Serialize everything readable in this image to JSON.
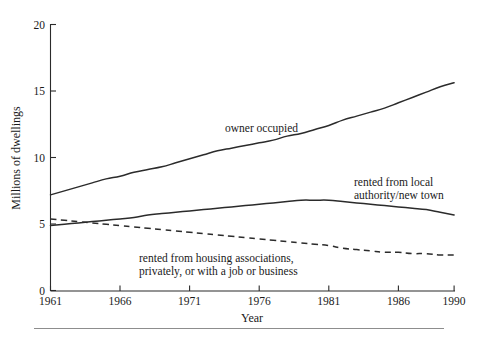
{
  "chart_data": {
    "type": "line",
    "title": "",
    "subtitle": "",
    "xlabel": "Year",
    "ylabel": "Millions of dwellings",
    "xlim": [
      1961,
      1990
    ],
    "ylim": [
      0,
      20
    ],
    "xticks": [
      1961,
      1966,
      1971,
      1976,
      1981,
      1986,
      1990
    ],
    "xtick_labels": [
      "1961",
      "1966",
      "1971",
      "1976",
      "1981",
      "1986",
      "1990"
    ],
    "yticks": [
      0,
      5,
      10,
      15,
      20
    ],
    "ytick_labels": [
      "0",
      "5",
      "10",
      "15",
      "20"
    ],
    "grid": false,
    "legend_position": "inline-annotations",
    "x": [
      1961,
      1962,
      1963,
      1964,
      1965,
      1966,
      1967,
      1968,
      1969,
      1970,
      1971,
      1972,
      1973,
      1974,
      1975,
      1976,
      1977,
      1978,
      1979,
      1980,
      1981,
      1982,
      1983,
      1984,
      1985,
      1986,
      1987,
      1988,
      1989,
      1990
    ],
    "series": [
      {
        "name": "owner occupied",
        "style": "solid",
        "color": "#2b2b2b",
        "values": [
          7.2,
          7.5,
          7.8,
          8.1,
          8.4,
          8.6,
          8.9,
          9.1,
          9.3,
          9.6,
          9.9,
          10.2,
          10.5,
          10.7,
          10.9,
          11.1,
          11.3,
          11.6,
          11.8,
          12.1,
          12.4,
          12.8,
          13.1,
          13.4,
          13.7,
          14.1,
          14.5,
          14.9,
          15.3,
          15.6
        ]
      },
      {
        "name": "rented from local authority/new town",
        "style": "solid",
        "color": "#2b2b2b",
        "values": [
          4.9,
          5.0,
          5.1,
          5.2,
          5.3,
          5.4,
          5.5,
          5.7,
          5.8,
          5.9,
          6.0,
          6.1,
          6.2,
          6.3,
          6.4,
          6.5,
          6.6,
          6.7,
          6.8,
          6.8,
          6.8,
          6.7,
          6.6,
          6.5,
          6.4,
          6.3,
          6.2,
          6.1,
          5.9,
          5.7
        ]
      },
      {
        "name": "rented from housing associations, privately, or with a job or business",
        "style": "dashed",
        "color": "#2b2b2b",
        "values": [
          5.4,
          5.3,
          5.2,
          5.1,
          5.0,
          4.9,
          4.8,
          4.7,
          4.6,
          4.5,
          4.4,
          4.3,
          4.2,
          4.1,
          4.0,
          3.9,
          3.8,
          3.7,
          3.6,
          3.5,
          3.4,
          3.2,
          3.1,
          3.0,
          2.9,
          2.9,
          2.8,
          2.8,
          2.7,
          2.7
        ]
      }
    ],
    "annotations": [
      {
        "id": "owner-occupied",
        "lines": [
          "owner occupied"
        ],
        "x_px": 225,
        "y_px": 132
      },
      {
        "id": "rented-local-authority",
        "lines": [
          "rented from local",
          "authority/new town"
        ],
        "x_px": 354,
        "y_px": 186
      },
      {
        "id": "rented-housing-associations",
        "lines": [
          "rented from housing associations,",
          "privately, or with a job or business"
        ],
        "x_px": 139,
        "y_px": 262
      }
    ]
  }
}
